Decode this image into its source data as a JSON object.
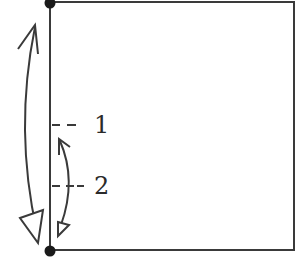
{
  "diagram": {
    "colors": {
      "stroke": "#3a3a3a",
      "dot": "#1a1a1a",
      "background": "#ffffff"
    },
    "labels": [
      {
        "id": "1",
        "text": "1"
      },
      {
        "id": "2",
        "text": "2"
      }
    ],
    "elements": {
      "rectangle": "square panel outline",
      "top_dot": "pivot point top",
      "bottom_dot": "pivot point bottom",
      "large_arrow": "double-headed curved arrow spanning full height",
      "small_arrow": "double-headed curved arrow spanning lower section",
      "marker_1": "dashed reference line 1",
      "marker_2": "dashed reference line 2"
    }
  }
}
